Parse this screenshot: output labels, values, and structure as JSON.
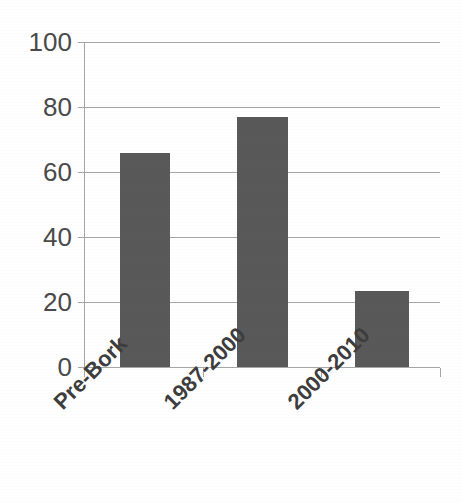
{
  "chart_data": {
    "type": "bar",
    "title": "",
    "subtitle": "",
    "xlabel": "",
    "ylabel": "",
    "categories": [
      "Pre-Bork",
      "1987-2000",
      "2000-2010"
    ],
    "values": [
      66,
      77,
      23.5
    ],
    "series": [
      {
        "name": "",
        "values": [
          66,
          77,
          23.5
        ]
      }
    ],
    "ylim": [
      0,
      100
    ],
    "yticks": [
      0,
      20,
      40,
      60,
      80,
      100
    ],
    "ytick_labels": [
      "0",
      "20",
      "40",
      "60",
      "80",
      "100"
    ],
    "grid": "horizontal",
    "legend": "none",
    "bar_color": "#595959",
    "gridline_color": "#a6a6a6",
    "background_color": "#ffffff",
    "annotations": []
  },
  "axis": {
    "y": {
      "labels": [
        "100",
        "80",
        "60",
        "40",
        "20",
        "0"
      ]
    },
    "x": {
      "labels": [
        "Pre-Bork",
        "1987-2000",
        "2000-2010"
      ]
    }
  }
}
